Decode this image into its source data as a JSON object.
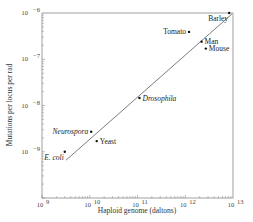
{
  "chart_data": {
    "type": "scatter",
    "title": "",
    "xlabel": "Haploid genome (daltons)",
    "ylabel": "Mutations per locus per rad",
    "xscale": "log",
    "yscale": "log",
    "xlim": [
      1000000000.0,
      10000000000000.0
    ],
    "ylim": [
      1e-10,
      1e-06
    ],
    "x_ticks": [
      {
        "value": 1000000000.0,
        "label": "10^9",
        "base": "10",
        "exp": "9"
      },
      {
        "value": 10000000000.0,
        "label": "10^10",
        "base": "10",
        "exp": "10"
      },
      {
        "value": 100000000000.0,
        "label": "10^11",
        "base": "10",
        "exp": "11"
      },
      {
        "value": 1000000000000.0,
        "label": "10^12",
        "base": "10",
        "exp": "12"
      },
      {
        "value": 10000000000000.0,
        "label": "10^13",
        "base": "10",
        "exp": "13"
      }
    ],
    "y_ticks": [
      {
        "value": 1e-06,
        "label": "10^-6",
        "base": "10",
        "exp": "−6"
      },
      {
        "value": 1e-07,
        "label": "10^-7",
        "base": "10",
        "exp": "−7"
      },
      {
        "value": 1e-08,
        "label": "10^-8",
        "base": "10",
        "exp": "−8"
      },
      {
        "value": 1e-09,
        "label": "10^-9",
        "base": "10",
        "exp": "−9"
      }
    ],
    "grid": false,
    "legend": null,
    "points": [
      {
        "name": "E. coli",
        "x": 3000000000.0,
        "y": 1e-09,
        "italic": true,
        "label_pos": "below-left"
      },
      {
        "name": "Neurospora",
        "x": 10700000000.0,
        "y": 2.7e-09,
        "italic": true,
        "label_pos": "left"
      },
      {
        "name": "Yeast",
        "x": 14000000000.0,
        "y": 1.7e-09,
        "italic": false,
        "label_pos": "right"
      },
      {
        "name": "Drosophila",
        "x": 110000000000.0,
        "y": 1.45e-08,
        "italic": true,
        "label_pos": "right"
      },
      {
        "name": "Tomato",
        "x": 1200000000000.0,
        "y": 3.9e-07,
        "italic": false,
        "label_pos": "left"
      },
      {
        "name": "Man",
        "x": 2200000000000.0,
        "y": 2.4e-07,
        "italic": false,
        "label_pos": "right"
      },
      {
        "name": "Mouse",
        "x": 2700000000000.0,
        "y": 1.7e-07,
        "italic": false,
        "label_pos": "right"
      },
      {
        "name": "Barley",
        "x": 8300000000000.0,
        "y": 1e-06,
        "italic": false,
        "label_pos": "below-left"
      }
    ],
    "fit_line": {
      "x0": 3200000000.0,
      "y0": 6.6e-10,
      "x1": 9500000000000.0,
      "y1": 9.5e-07
    }
  }
}
